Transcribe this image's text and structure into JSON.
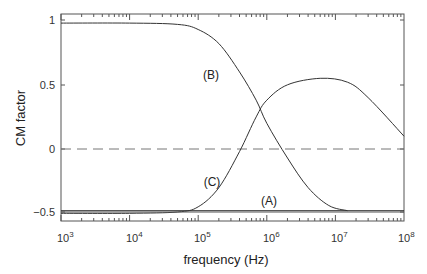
{
  "chart_data": {
    "type": "line",
    "title": "",
    "xlabel": "frequency (Hz)",
    "ylabel": "CM factor",
    "xscale": "log",
    "xlim": [
      1000,
      100000000
    ],
    "ylim": [
      -0.55,
      1.05
    ],
    "x_ticks": [
      "10^3",
      "10^4",
      "10^5",
      "10^6",
      "10^7",
      "10^8"
    ],
    "y_ticks": [
      "1",
      "0.5",
      "0",
      "-0.5"
    ],
    "grid": false,
    "legend": "none (inline curve labels)",
    "reference_line": {
      "y": 0,
      "style": "dashed"
    },
    "series": [
      {
        "name": "(A)",
        "x": [
          1000,
          100000000
        ],
        "y": [
          -0.48,
          -0.48
        ]
      },
      {
        "name": "(B)",
        "x": [
          1000,
          10000,
          50000,
          100000,
          200000,
          400000,
          700000,
          1000000,
          2000000,
          4000000,
          8000000,
          15000000
        ],
        "y": [
          0.98,
          0.98,
          0.97,
          0.93,
          0.82,
          0.6,
          0.38,
          0.2,
          -0.07,
          -0.3,
          -0.44,
          -0.48
        ]
      },
      {
        "name": "(C)",
        "x": [
          1000,
          10000,
          50000,
          100000,
          200000,
          400000,
          700000,
          1000000,
          2000000,
          6000000,
          15000000,
          30000000,
          100000000
        ],
        "y": [
          -0.5,
          -0.5,
          -0.49,
          -0.45,
          -0.3,
          -0.02,
          0.25,
          0.38,
          0.5,
          0.55,
          0.52,
          0.4,
          0.1
        ]
      }
    ]
  },
  "labels": {
    "xlabel": "frequency (Hz)",
    "ylabel": "CM factor",
    "curve_a": "(A)",
    "curve_b": "(B)",
    "curve_c": "(C)",
    "y_tick_1": "1",
    "y_tick_05": "0.5",
    "y_tick_0": "0",
    "y_tick_m05": "−0.5",
    "x_base": "10",
    "x_exp_3": "3",
    "x_exp_4": "4",
    "x_exp_5": "5",
    "x_exp_6": "6",
    "x_exp_7": "7",
    "x_exp_8": "8"
  }
}
